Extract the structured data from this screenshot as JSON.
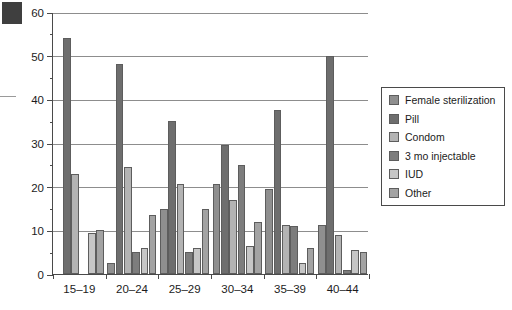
{
  "chart_data": {
    "type": "bar",
    "title": "",
    "xlabel": "",
    "ylabel": "",
    "categories": [
      "15–19",
      "20–24",
      "25–29",
      "30–34",
      "35–39",
      "40–44"
    ],
    "ylim": [
      0,
      60
    ],
    "yticks": [
      0,
      10,
      20,
      30,
      40,
      50,
      60
    ],
    "ytick_labels": [
      "0",
      "10",
      "20",
      "30",
      "40",
      "50",
      "60"
    ],
    "minor_tick_step": 5,
    "grid": "horizontal",
    "legend_position": "right",
    "series": [
      {
        "name": "Female sterilization",
        "color": "#8f8f8f",
        "values": [
          0,
          2.5,
          15,
          20.5,
          19.5,
          11.3
        ]
      },
      {
        "name": "Pill",
        "color": "#6e6e6e",
        "values": [
          54,
          48,
          35,
          29.5,
          37.5,
          50
        ]
      },
      {
        "name": "Condom",
        "color": "#b3b3b3",
        "values": [
          23,
          24.5,
          20.5,
          17,
          11.3,
          9
        ]
      },
      {
        "name": "3 mo injectable",
        "color": "#7d7d7d",
        "values": [
          0,
          5,
          5,
          25,
          11,
          1
        ]
      },
      {
        "name": "IUD",
        "color": "#c6c6c6",
        "values": [
          9.5,
          6,
          6,
          6.5,
          2.5,
          5.5
        ]
      },
      {
        "name": "Other",
        "color": "#a3a3a3",
        "values": [
          10,
          13.5,
          14.8,
          11.8,
          6,
          5
        ]
      }
    ]
  },
  "legend": {
    "items": [
      {
        "label": "Female sterilization"
      },
      {
        "label": "Pill"
      },
      {
        "label": "Condom"
      },
      {
        "label": "3 mo injectable"
      },
      {
        "label": "IUD"
      },
      {
        "label": "Other"
      }
    ]
  }
}
